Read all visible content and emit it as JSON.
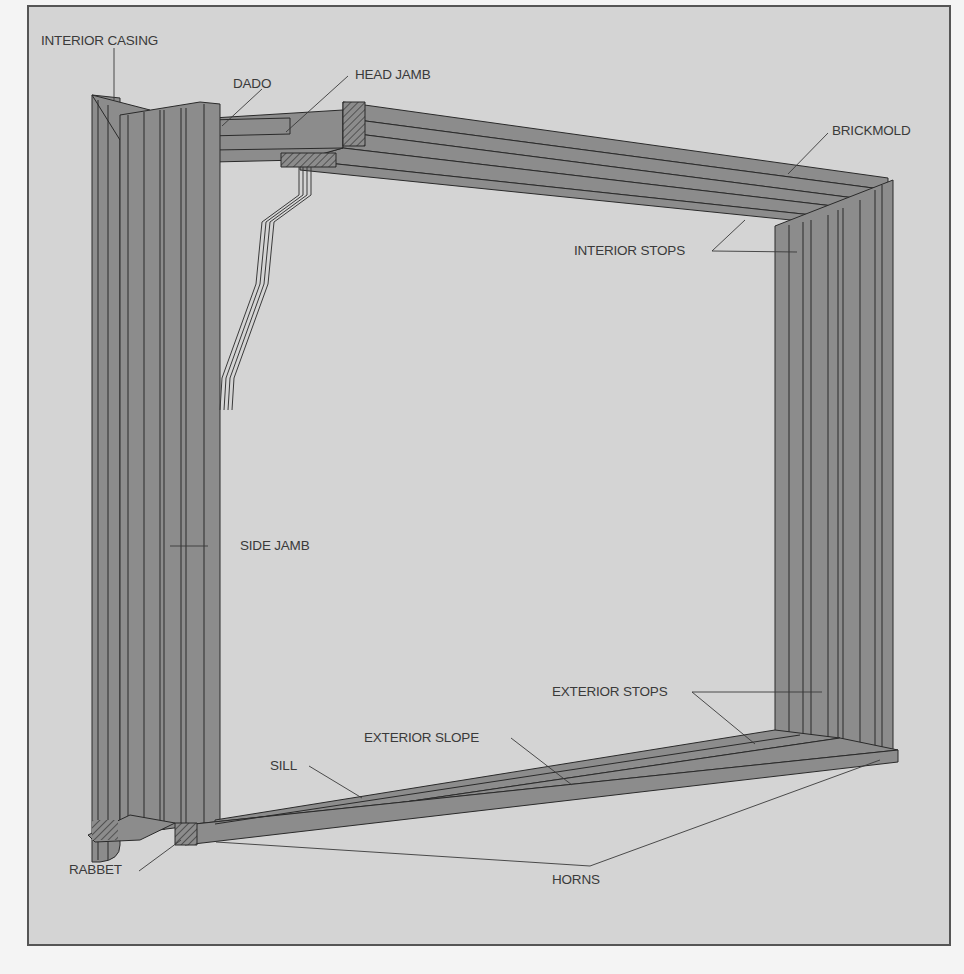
{
  "diagram": {
    "colors": {
      "background": "#d4d4d4",
      "wood": "#8c8c8c",
      "wood_dark": "#7a7a7a",
      "line": "#2a2a2a",
      "label": "#3a3a3a"
    },
    "labels": [
      {
        "id": "interior-casing",
        "text": "INTERIOR CASING"
      },
      {
        "id": "dado",
        "text": "DADO"
      },
      {
        "id": "head-jamb",
        "text": "HEAD JAMB"
      },
      {
        "id": "brickmold",
        "text": "BRICKMOLD"
      },
      {
        "id": "interior-stops",
        "text": "INTERIOR STOPS"
      },
      {
        "id": "side-jamb",
        "text": "SIDE JAMB"
      },
      {
        "id": "exterior-stops",
        "text": "EXTERIOR STOPS"
      },
      {
        "id": "exterior-slope",
        "text": "EXTERIOR SLOPE"
      },
      {
        "id": "sill",
        "text": "SILL"
      },
      {
        "id": "rabbet",
        "text": "RABBET"
      },
      {
        "id": "horns",
        "text": "HORNS"
      }
    ]
  }
}
